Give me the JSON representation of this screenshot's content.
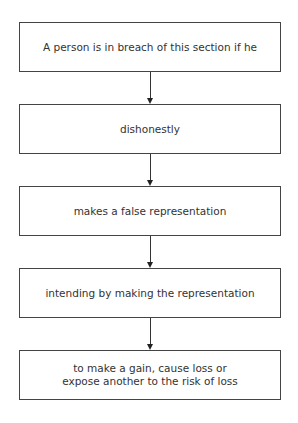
{
  "diagram": {
    "type": "flowchart",
    "direction": "top-to-bottom",
    "nodes": [
      {
        "id": "n1",
        "label": "A person is in breach of this section if he"
      },
      {
        "id": "n2",
        "label": "dishonestly"
      },
      {
        "id": "n3",
        "label": "makes a false representation"
      },
      {
        "id": "n4",
        "label": "intending by making the representation"
      },
      {
        "id": "n5",
        "label": "to make a gain, cause loss or expose another to the risk of loss"
      }
    ],
    "edges": [
      {
        "from": "n1",
        "to": "n2"
      },
      {
        "from": "n2",
        "to": "n3"
      },
      {
        "from": "n3",
        "to": "n4"
      },
      {
        "from": "n4",
        "to": "n5"
      }
    ]
  }
}
